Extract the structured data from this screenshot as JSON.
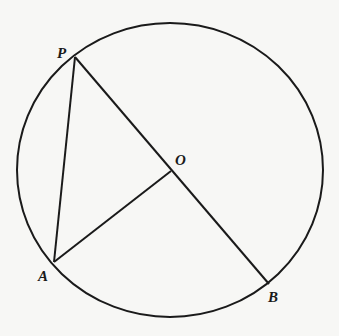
{
  "diagram": {
    "type": "circle-geometry",
    "stroke_color": "#1a1a1a",
    "background": "#f7f7f5",
    "circle": {
      "cx": 170,
      "cy": 170,
      "rx": 153,
      "ry": 147
    },
    "points": {
      "P": {
        "x": 75,
        "y": 57
      },
      "O": {
        "x": 171,
        "y": 171
      },
      "A": {
        "x": 54,
        "y": 262
      },
      "B": {
        "x": 269,
        "y": 284
      }
    },
    "segments": [
      {
        "from": "P",
        "to": "B",
        "note": "diameter through O"
      },
      {
        "from": "P",
        "to": "A"
      },
      {
        "from": "A",
        "to": "O"
      }
    ],
    "labels": {
      "P": "P",
      "O": "O",
      "A": "A",
      "B": "B"
    }
  }
}
